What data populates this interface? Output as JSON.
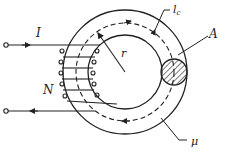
{
  "diagram": {
    "type": "toroidal-core-with-winding",
    "labels": {
      "current": "I",
      "turns": "N",
      "radius": "r",
      "mean_path_length": "l",
      "mean_path_subscript": "c",
      "cross_section_area": "A",
      "permeability": "μ"
    },
    "colors": {
      "stroke": "#222222",
      "background": "#ffffff"
    }
  }
}
